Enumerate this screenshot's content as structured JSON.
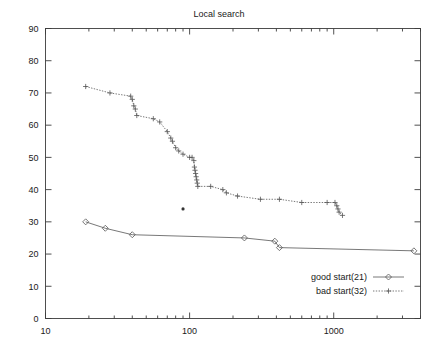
{
  "chart_data": {
    "type": "line",
    "title": "Local search",
    "xlabel": "",
    "ylabel": "",
    "xscale": "log",
    "yscale": "linear",
    "xlim": [
      10,
      4000
    ],
    "ylim": [
      0,
      90
    ],
    "grid": false,
    "legend_position": "bottom-right",
    "x_tick_labels": [
      "10",
      "100",
      "1000"
    ],
    "x_tick_values": [
      10,
      100,
      1000
    ],
    "y_tick_labels": [
      "0",
      "10",
      "20",
      "30",
      "40",
      "50",
      "60",
      "70",
      "80",
      "90"
    ],
    "y_tick_values": [
      0,
      10,
      20,
      30,
      40,
      50,
      60,
      70,
      80,
      90
    ],
    "series": [
      {
        "name": "good start(21)",
        "marker": "diamond",
        "linestyle": "solid",
        "color": "#555555",
        "points": [
          [
            19,
            30
          ],
          [
            26,
            28
          ],
          [
            40,
            26
          ],
          [
            240,
            25
          ],
          [
            390,
            24
          ],
          [
            420,
            22
          ],
          [
            3600,
            21
          ]
        ]
      },
      {
        "name": "bad start(32)",
        "marker": "plus",
        "linestyle": "dotted",
        "color": "#555555",
        "points": [
          [
            19,
            72
          ],
          [
            28,
            70
          ],
          [
            39,
            69
          ],
          [
            40,
            68
          ],
          [
            41,
            66
          ],
          [
            42,
            65
          ],
          [
            43,
            63
          ],
          [
            56,
            62
          ],
          [
            62,
            61
          ],
          [
            70,
            58
          ],
          [
            74,
            56
          ],
          [
            76,
            55
          ],
          [
            80,
            53
          ],
          [
            84,
            52
          ],
          [
            90,
            51
          ],
          [
            100,
            50
          ],
          [
            104,
            50
          ],
          [
            107,
            49
          ],
          [
            108,
            47
          ],
          [
            109,
            46
          ],
          [
            110,
            45
          ],
          [
            111,
            44
          ],
          [
            112,
            43
          ],
          [
            113,
            42
          ],
          [
            114,
            41
          ],
          [
            140,
            41
          ],
          [
            170,
            40
          ],
          [
            180,
            39
          ],
          [
            215,
            38
          ],
          [
            310,
            37
          ],
          [
            420,
            37
          ],
          [
            600,
            36
          ],
          [
            900,
            36
          ],
          [
            1020,
            36
          ],
          [
            1050,
            35
          ],
          [
            1070,
            34
          ],
          [
            1090,
            33
          ],
          [
            1150,
            32
          ]
        ]
      }
    ],
    "annotations": [
      {
        "name": "isolated-point",
        "x": 90,
        "y": 34,
        "marker": "dot"
      }
    ]
  },
  "legend": {
    "entries": [
      {
        "label": "good start(21)"
      },
      {
        "label": "bad start(32)"
      }
    ]
  }
}
